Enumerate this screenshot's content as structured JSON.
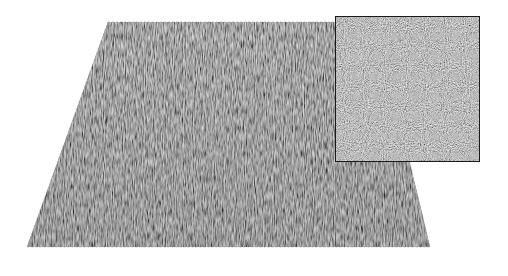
{
  "figure": {
    "surface": {
      "corners": [
        [
          108,
          22
        ],
        [
          376,
          22
        ],
        [
          430,
          247
        ],
        [
          27,
          247
        ]
      ],
      "base_color": "#7d7d7d",
      "highlight_color": "#b5b5b5",
      "shadow_color": "#505050"
    },
    "inset": {
      "x": 335,
      "y": 16,
      "width": 145,
      "height": 146,
      "border_color": "#1a1a1a",
      "fill_color": "#8a8a8a"
    }
  }
}
